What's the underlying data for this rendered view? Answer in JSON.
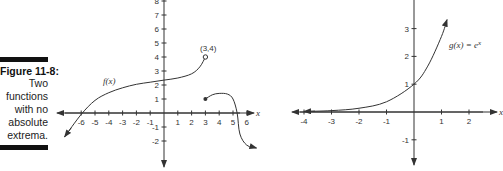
{
  "caption": {
    "title": "Figure 11-8:",
    "lines": [
      "Two",
      "functions",
      "with no",
      "absolute",
      "extrema."
    ]
  },
  "chart_data": [
    {
      "type": "line",
      "title": "f(x)",
      "xlabel": "x",
      "ylabel": "",
      "x_ticks": [
        -6,
        -5,
        -4,
        -3,
        -2,
        -1,
        1,
        2,
        3,
        4,
        5,
        6
      ],
      "y_ticks": [
        -2,
        -1,
        1,
        2,
        3,
        4,
        5,
        6,
        7,
        8
      ],
      "xlim": [
        -7.5,
        7
      ],
      "ylim": [
        -3,
        8
      ],
      "annotations": [
        {
          "text": "(3,4)",
          "x": 3,
          "y": 4,
          "marker": "open-circle"
        },
        {
          "text": "f(x)",
          "x": -3,
          "y": 2
        }
      ],
      "series": [
        {
          "name": "f(x) left piece",
          "x": [
            -7.2,
            -6,
            -5,
            -4,
            -3,
            -2,
            -1,
            0,
            1,
            2,
            2.6,
            3
          ],
          "y": [
            -1.7,
            -0.1,
            0.9,
            1.45,
            1.8,
            2.05,
            2.2,
            2.35,
            2.5,
            2.8,
            3.3,
            4
          ],
          "end_left": "arrow",
          "end_right": "open-circle"
        },
        {
          "name": "f(x) right piece",
          "x": [
            3,
            3.5,
            4,
            4.6,
            5,
            5.3,
            5.5,
            6,
            6.7
          ],
          "y": [
            1,
            1.3,
            1.4,
            1.35,
            1,
            0,
            -1.5,
            -2.3,
            -2.5
          ],
          "end_left": "closed-circle",
          "end_right": "arrow"
        }
      ]
    },
    {
      "type": "line",
      "title": "g(x) = e^x",
      "xlabel": "x",
      "ylabel": "",
      "x_ticks": [
        -4,
        -3,
        -2,
        -1,
        1,
        2
      ],
      "y_ticks": [
        -1,
        1,
        2,
        3,
        4
      ],
      "xlim": [
        -4.3,
        3
      ],
      "ylim": [
        -1.9,
        4
      ],
      "annotations": [
        {
          "text": "g(x) = e^x",
          "x": 1.3,
          "y": 2.8
        }
      ],
      "series": [
        {
          "name": "g(x) = e^x",
          "x": [
            -4,
            -3,
            -2,
            -1,
            0,
            0.5,
            1,
            1.2
          ],
          "y": [
            0.018,
            0.05,
            0.135,
            0.368,
            1,
            1.65,
            2.72,
            3.32
          ],
          "end_left": "arrow",
          "end_right": "arrow"
        }
      ]
    }
  ],
  "labels": {
    "left_fx": "f(x)",
    "left_point": "(3,4)",
    "right_gx": "g(x) = e",
    "right_gx_sup": "x",
    "x_axis": "x"
  }
}
